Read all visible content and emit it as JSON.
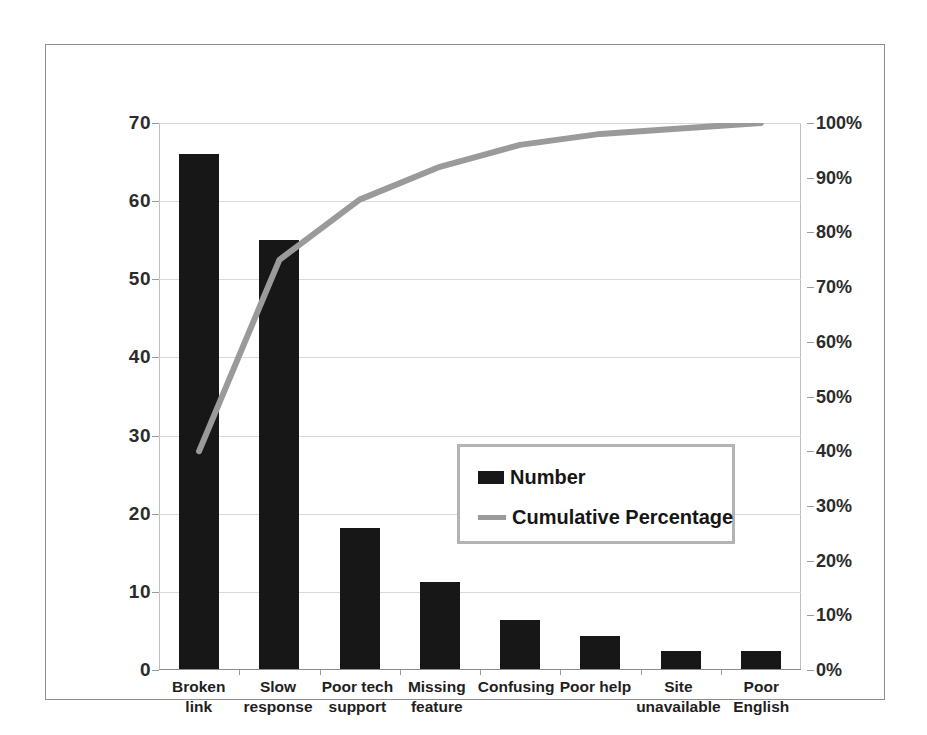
{
  "chart_data": {
    "type": "bar",
    "title": "",
    "subtitle": "",
    "xlabel": "",
    "ylabel": "",
    "y2label": "",
    "categories": [
      "Broken link",
      "Slow response",
      "Poor tech support",
      "Missing feature",
      "Confusing",
      "Poor help",
      "Site unavailable",
      "Poor English"
    ],
    "category_lines": [
      [
        "Broken link"
      ],
      [
        "Slow",
        "response"
      ],
      [
        "Poor tech",
        "support"
      ],
      [
        "Missing",
        "feature"
      ],
      [
        "Confusing"
      ],
      [
        "Poor help"
      ],
      [
        "Site",
        "unavailable"
      ],
      [
        "Poor English"
      ]
    ],
    "series": [
      {
        "name": "Number",
        "type": "bar",
        "axis": "left",
        "color": "#171717",
        "values": [
          66,
          55,
          18.2,
          11.3,
          6.4,
          4.4,
          2.4,
          2.4
        ]
      },
      {
        "name": "Cumulative Percentage",
        "type": "line",
        "axis": "right",
        "color": "#9a9a9a",
        "values": [
          40,
          75,
          86,
          92,
          96,
          98,
          99,
          100
        ]
      }
    ],
    "ylim": [
      0,
      70
    ],
    "y2lim": [
      0,
      100
    ],
    "yticks": [
      0,
      10,
      20,
      30,
      40,
      50,
      60,
      70
    ],
    "ytick_labels": [
      "0",
      "10",
      "20",
      "30",
      "40",
      "50",
      "60",
      "70"
    ],
    "y2ticks": [
      0,
      10,
      20,
      30,
      40,
      50,
      60,
      70,
      80,
      90,
      100
    ],
    "y2tick_labels": [
      "0%",
      "10%",
      "20%",
      "30%",
      "40%",
      "50%",
      "60%",
      "70%",
      "80%",
      "90%",
      "100%"
    ],
    "grid": true,
    "grid_axis": "y",
    "legend_position": "center"
  },
  "legend": {
    "items": [
      {
        "label": "Number",
        "marker": "bar-swatch",
        "color": "#171717"
      },
      {
        "label": "Cumulative Percentage",
        "marker": "line-swatch",
        "color": "#9a9a9a"
      }
    ]
  },
  "colors": {
    "bar": "#171717",
    "line": "#9a9a9a",
    "grid": "#d9d9d9",
    "frame": "#8d8d8d",
    "text": "#1f1f1f",
    "background": "#ffffff"
  }
}
